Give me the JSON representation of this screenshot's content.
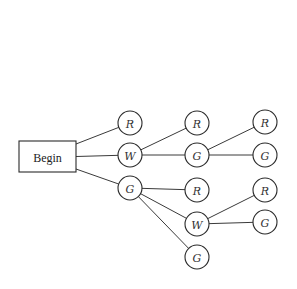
{
  "diagram": {
    "type": "tree",
    "start": {
      "id": "begin",
      "label": "Begin",
      "x": 19,
      "y": 141,
      "w": 57,
      "h": 31
    },
    "node_radius": 12,
    "nodes": [
      {
        "id": "c1_r",
        "label": "R",
        "x": 130,
        "y": 123
      },
      {
        "id": "c1_w",
        "label": "W",
        "x": 130,
        "y": 155
      },
      {
        "id": "c1_g",
        "label": "G",
        "x": 130,
        "y": 188
      },
      {
        "id": "c2_r_a",
        "label": "R",
        "x": 197,
        "y": 123
      },
      {
        "id": "c2_g_a",
        "label": "G",
        "x": 197,
        "y": 155
      },
      {
        "id": "c2_r_b",
        "label": "R",
        "x": 197,
        "y": 190
      },
      {
        "id": "c2_w_b",
        "label": "W",
        "x": 197,
        "y": 224
      },
      {
        "id": "c2_g_b",
        "label": "G",
        "x": 197,
        "y": 257
      },
      {
        "id": "c3_r_a",
        "label": "R",
        "x": 265,
        "y": 122
      },
      {
        "id": "c3_g_a",
        "label": "G",
        "x": 265,
        "y": 155
      },
      {
        "id": "c3_r_b",
        "label": "R",
        "x": 265,
        "y": 190
      },
      {
        "id": "c3_g_b",
        "label": "G",
        "x": 265,
        "y": 222
      }
    ],
    "edges": [
      [
        "begin",
        "c1_r"
      ],
      [
        "begin",
        "c1_w"
      ],
      [
        "begin",
        "c1_g"
      ],
      [
        "c1_w",
        "c2_r_a"
      ],
      [
        "c1_w",
        "c2_g_a"
      ],
      [
        "c2_g_a",
        "c3_r_a"
      ],
      [
        "c2_g_a",
        "c3_g_a"
      ],
      [
        "c1_g",
        "c2_r_b"
      ],
      [
        "c1_g",
        "c2_w_b"
      ],
      [
        "c1_g",
        "c2_g_b"
      ],
      [
        "c2_w_b",
        "c3_r_b"
      ],
      [
        "c2_w_b",
        "c3_g_b"
      ]
    ]
  }
}
